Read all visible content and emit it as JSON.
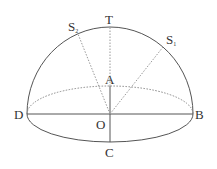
{
  "diagram": {
    "type": "hemisphere-geometry",
    "colors": {
      "stroke": "#555555",
      "dashed": "#999999",
      "text": "#333333"
    },
    "points": {
      "T": {
        "label": "T"
      },
      "S1": {
        "label": "S",
        "sub": "1"
      },
      "S2": {
        "label": "S",
        "sub": "2"
      },
      "A": {
        "label": "A"
      },
      "O": {
        "label": "O"
      },
      "B": {
        "label": "B"
      },
      "C": {
        "label": "C"
      },
      "D": {
        "label": "D"
      }
    },
    "elements": [
      "hemisphere dome arc from D to B (solid)",
      "base ellipse: back half dashed, front half solid",
      "diameter DB (solid)",
      "OC (solid)",
      "OA (solid)",
      "OT (dashed)",
      "OS1 (dashed)",
      "OS2 (dashed)"
    ]
  }
}
